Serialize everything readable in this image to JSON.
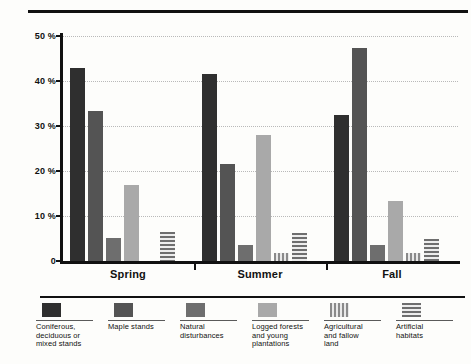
{
  "chart_data": {
    "type": "bar",
    "title": "",
    "xlabel": "",
    "ylabel": "",
    "ylim": [
      0,
      50
    ],
    "grid": true,
    "legend_position": "bottom",
    "categories": [
      "Spring",
      "Summer",
      "Fall"
    ],
    "ytick_labels": [
      "50 %",
      "40 %",
      "30 %",
      "20 %",
      "10 %",
      "0"
    ],
    "ytick_values": [
      50,
      40,
      30,
      20,
      10,
      0
    ],
    "series": [
      {
        "name": "Coniferous, deciduous or mixed stands",
        "swatch": "solid-darkest",
        "color": "#2f2f2f",
        "values": [
          43.0,
          41.5,
          32.4
        ]
      },
      {
        "name": "Maple stands",
        "swatch": "solid-dark",
        "color": "#545454",
        "values": [
          33.3,
          21.5,
          47.3
        ]
      },
      {
        "name": "Natural disturbances",
        "swatch": "solid-medium",
        "color": "#6e6e6e",
        "values": [
          5.2,
          3.6,
          3.5
        ]
      },
      {
        "name": "Logged forests and young plantations",
        "swatch": "solid-light",
        "color": "#a9a9a9",
        "values": [
          17.0,
          28.0,
          13.4
        ]
      },
      {
        "name": "Agricultural and fallow land",
        "swatch": "vertical-stripes",
        "color": "#8a8a8a",
        "values": [
          0,
          1.8,
          1.7
        ]
      },
      {
        "name": "Artificial habitats",
        "swatch": "horizontal-stripes",
        "color": "#6e6e6e",
        "values": [
          6.5,
          6.3,
          5.0
        ]
      }
    ]
  },
  "legend": {
    "items": [
      {
        "label": "Coniferous,\ndeciduous or\nmixed stands"
      },
      {
        "label": "Maple stands"
      },
      {
        "label": "Natural\ndisturbances"
      },
      {
        "label": "Logged forests\nand young\nplantations"
      },
      {
        "label": "Agricultural\nand fallow\nland"
      },
      {
        "label": "Artificial\nhabitats"
      }
    ]
  }
}
